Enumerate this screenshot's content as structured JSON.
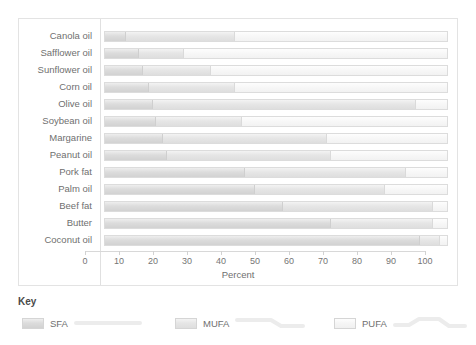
{
  "chart_data": {
    "type": "bar",
    "orientation": "horizontal",
    "stacked": true,
    "title": "",
    "xlabel": "Percent",
    "ylabel": "",
    "xlim": [
      0,
      100
    ],
    "grid": false,
    "legend_position": "bottom",
    "legend_title": "Key",
    "categories": [
      "Canola oil",
      "Safflower oil",
      "Sunflower oil",
      "Corn oil",
      "Olive oil",
      "Soybean oil",
      "Margarine",
      "Peanut oil",
      "Pork fat",
      "Palm oil",
      "Beef fat",
      "Butter",
      "Coconut oil"
    ],
    "tick_labels": [
      "0",
      "10",
      "20",
      "30",
      "40",
      "50",
      "60",
      "70",
      "80",
      "90",
      "100"
    ],
    "tick_values": [
      0,
      10,
      20,
      30,
      40,
      50,
      60,
      70,
      80,
      90,
      100
    ],
    "series": [
      {
        "name": "SFA",
        "values": [
          6,
          10,
          11,
          13,
          14,
          15,
          17,
          18,
          41,
          44,
          52,
          66,
          92
        ]
      },
      {
        "name": "MUFA",
        "values": [
          32,
          13,
          20,
          25,
          77,
          25,
          48,
          48,
          47,
          38,
          44,
          30,
          6
        ]
      },
      {
        "name": "PUFA",
        "values": [
          62,
          77,
          69,
          62,
          9,
          60,
          35,
          34,
          12,
          18,
          4,
          4,
          2
        ]
      }
    ],
    "cumulative_boundaries": {
      "sfa_end": [
        6,
        10,
        11,
        13,
        14,
        15,
        17,
        18,
        41,
        44,
        52,
        66,
        92
      ],
      "mufa_end": [
        38,
        23,
        31,
        38,
        91,
        40,
        65,
        66,
        88,
        82,
        96,
        96,
        98
      ]
    },
    "colors": {
      "sfa": "#dcdcdc",
      "mufa": "#e6e6e6",
      "pufa": "#f7f7f7",
      "border": "#dcdcdc",
      "axis": "#d8d8d8",
      "text": "#6f6f6f"
    }
  },
  "legend": {
    "title": "Key",
    "items": [
      {
        "label": "SFA"
      },
      {
        "label": "MUFA"
      },
      {
        "label": "PUFA"
      }
    ]
  }
}
